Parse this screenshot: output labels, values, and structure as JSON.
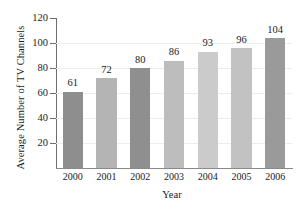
{
  "chart_data": {
    "type": "bar",
    "title": "",
    "xlabel": "Year",
    "ylabel": "Average Number of TV Channels",
    "categories": [
      "2000",
      "2001",
      "2002",
      "2003",
      "2004",
      "2005",
      "2006"
    ],
    "values": [
      61,
      72,
      80,
      86,
      93,
      96,
      104
    ],
    "value_labels": [
      "61",
      "72",
      "80",
      "86",
      "93",
      "96",
      "104"
    ],
    "ylim": [
      0,
      120
    ],
    "yticks": [
      20,
      40,
      60,
      80,
      100,
      120
    ],
    "ytick_labels": [
      "20",
      "40",
      "60",
      "80",
      "100",
      "120"
    ],
    "grid": true,
    "grid_axis": "y",
    "legend": false,
    "bar_colors": [
      "#8e8e8e",
      "#b4b4b4",
      "#8f8f8f",
      "#bdbdbd",
      "#cbcbcb",
      "#c2c2c2",
      "#9a9a9a"
    ],
    "axis_color": "#6e6e6e",
    "grid_color": "#ededed",
    "text_color": "#1a1a1a",
    "background": "#ffffff"
  }
}
